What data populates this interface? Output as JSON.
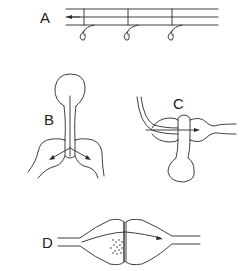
{
  "figure": {
    "background": "#ffffff",
    "stroke_color": "#2a2a2a",
    "panels": [
      {
        "id": "A",
        "label": "A",
        "description": "parallel fibers with three side branches ending in terminal knobs; leftward arrow"
      },
      {
        "id": "B",
        "label": "B",
        "description": "cell body with stem splitting into two bulbous branches; diverging arrows"
      },
      {
        "id": "C",
        "label": "C",
        "description": "bulb with stem crossing a fiber loop; rightward arrow"
      },
      {
        "id": "D",
        "label": "D",
        "description": "two apposed swellings with vesicle cluster at the junction; rightward arrow"
      }
    ]
  }
}
